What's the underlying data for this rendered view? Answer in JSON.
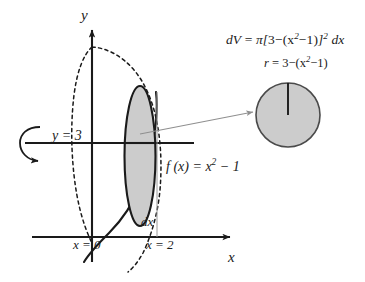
{
  "figure": {
    "background_color": "#ffffff",
    "stroke_color": "#1a1a1a",
    "fill_color": "#cccccc",
    "leader_color": "#8c8c8c"
  },
  "axes": {
    "y_label": "y",
    "x_label": "x"
  },
  "labels": {
    "axis_of_revolution": "y = 3",
    "lower_bound": "x = 0",
    "upper_bound": "x = 2",
    "thickness": "dx",
    "function": "f (x) = x",
    "function_exponent": "2",
    "function_tail": " − 1"
  },
  "equations": {
    "volume_element": {
      "lhs": "dV",
      "eq": " = ",
      "pi": "π",
      "bracket_open": "[",
      "inner": "3−(x",
      "inner_exponent": "2",
      "inner_tail": "−1)",
      "bracket_close": "]",
      "bracket_exponent": "2",
      "differential": " dx",
      "full_text": "dV = π[3−(x²−1)]² dx"
    },
    "radius": {
      "lhs": "r",
      "eq": " = ",
      "inner": "3−(x",
      "inner_exponent": "2",
      "inner_tail": "−1)",
      "full_text": "r = 3−(x²−1)"
    }
  },
  "shapes": {
    "disk_slice": "shaded-ellipse",
    "cross_section": "shaded-circle",
    "radius_line": "circle-radius",
    "rotation_arrow": "revolution-arrow",
    "solid_curve": "parabola-f-of-x",
    "dashed_curve": "reflected-parabola"
  }
}
